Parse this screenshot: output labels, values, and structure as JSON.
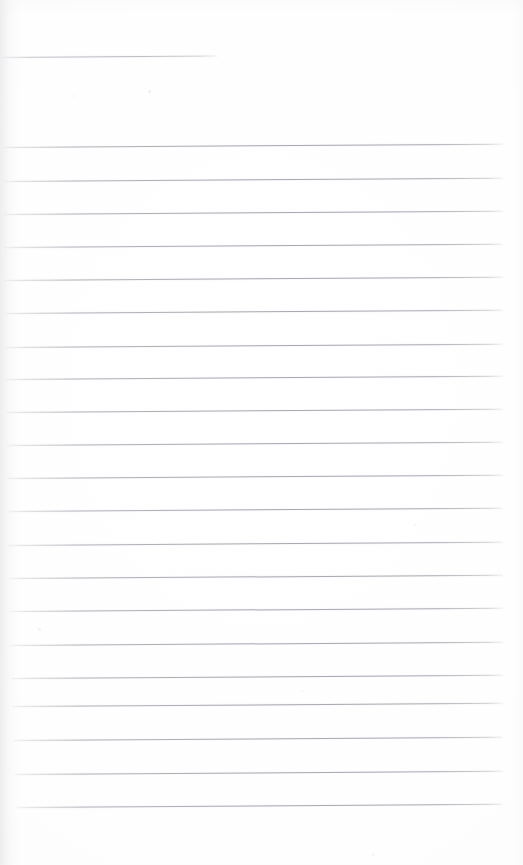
{
  "document": {
    "kind": "scanned-page",
    "caption": "Blank ruled notebook page",
    "page_width": 523,
    "page_height": 865,
    "background_color": "#ffffff",
    "has_text_content": false,
    "has_handwriting": false,
    "has_margin_rule": false,
    "visible_text": ""
  },
  "ruling": {
    "line_color": "#a8aab1",
    "line_color_faint": "#c9cace",
    "line_count": 22,
    "line_spacing_px": 33.5,
    "line_thickness_px": 1,
    "tilt_degrees": -0.38,
    "first_line_is_short": true,
    "lines": [
      {
        "index": 1,
        "y": 57,
        "x_start": 0,
        "x_end": 217,
        "weight": "faint"
      },
      {
        "index": 2,
        "y": 147,
        "x_start": 2,
        "x_end": 503,
        "weight": "normal"
      },
      {
        "index": 3,
        "y": 181,
        "x_start": 3,
        "x_end": 503,
        "weight": "normal"
      },
      {
        "index": 4,
        "y": 214,
        "x_start": 3,
        "x_end": 503,
        "weight": "normal"
      },
      {
        "index": 5,
        "y": 247,
        "x_start": 4,
        "x_end": 503,
        "weight": "normal"
      },
      {
        "index": 6,
        "y": 280,
        "x_start": 4,
        "x_end": 503,
        "weight": "normal"
      },
      {
        "index": 7,
        "y": 313,
        "x_start": 5,
        "x_end": 503,
        "weight": "normal"
      },
      {
        "index": 8,
        "y": 347,
        "x_start": 5,
        "x_end": 503,
        "weight": "normal"
      },
      {
        "index": 9,
        "y": 379,
        "x_start": 6,
        "x_end": 503,
        "weight": "normal"
      },
      {
        "index": 10,
        "y": 412,
        "x_start": 6,
        "x_end": 503,
        "weight": "normal"
      },
      {
        "index": 11,
        "y": 445,
        "x_start": 7,
        "x_end": 503,
        "weight": "normal"
      },
      {
        "index": 12,
        "y": 478,
        "x_start": 7,
        "x_end": 503,
        "weight": "normal"
      },
      {
        "index": 13,
        "y": 511,
        "x_start": 8,
        "x_end": 503,
        "weight": "normal"
      },
      {
        "index": 14,
        "y": 545,
        "x_start": 8,
        "x_end": 503,
        "weight": "normal"
      },
      {
        "index": 15,
        "y": 578,
        "x_start": 9,
        "x_end": 503,
        "weight": "normal"
      },
      {
        "index": 16,
        "y": 611,
        "x_start": 10,
        "x_end": 503,
        "weight": "normal"
      },
      {
        "index": 17,
        "y": 645,
        "x_start": 10,
        "x_end": 503,
        "weight": "normal"
      },
      {
        "index": 18,
        "y": 678,
        "x_start": 11,
        "x_end": 503,
        "weight": "normal"
      },
      {
        "index": 19,
        "y": 706,
        "x_start": 12,
        "x_end": 503,
        "weight": "normal"
      },
      {
        "index": 20,
        "y": 740,
        "x_start": 13,
        "x_end": 503,
        "weight": "normal"
      },
      {
        "index": 21,
        "y": 774,
        "x_start": 15,
        "x_end": 503,
        "weight": "normal"
      },
      {
        "index": 22,
        "y": 807,
        "x_start": 17,
        "x_end": 503,
        "weight": "normal"
      }
    ]
  },
  "margins": {
    "top_blank_px": 55,
    "bottom_blank_px": 58,
    "left_gutter_px": 10,
    "right_blank_px": 20
  },
  "speckles": [
    {
      "x": 148,
      "y": 90,
      "size": 3.0,
      "color": "rgba(236,236,238,0.85)"
    },
    {
      "x": 73,
      "y": 95,
      "size": 2.2,
      "color": "rgba(241,241,243,0.8)"
    },
    {
      "x": 414,
      "y": 524,
      "size": 2.4,
      "color": "rgba(240,240,242,0.8)"
    },
    {
      "x": 301,
      "y": 690,
      "size": 2.0,
      "color": "rgba(243,243,245,0.8)"
    },
    {
      "x": 372,
      "y": 853,
      "size": 3.2,
      "color": "rgba(241,241,243,0.75)"
    },
    {
      "x": 38,
      "y": 628,
      "size": 2.6,
      "color": "rgba(240,240,242,0.7)"
    }
  ]
}
